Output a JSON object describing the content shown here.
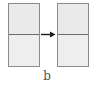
{
  "diagram": {
    "panels": [
      {
        "id": "before",
        "rows": 2
      },
      {
        "id": "after",
        "rows": 2
      }
    ],
    "arrow": {
      "direction": "right",
      "icon": "arrow-right-icon"
    },
    "caption": "b"
  },
  "colors": {
    "panel_fill": "#ececec",
    "panel_border": "#8a8a8a",
    "divider": "#6a6a6a",
    "arrow": "#1a1a1a",
    "caption": "#555555"
  }
}
